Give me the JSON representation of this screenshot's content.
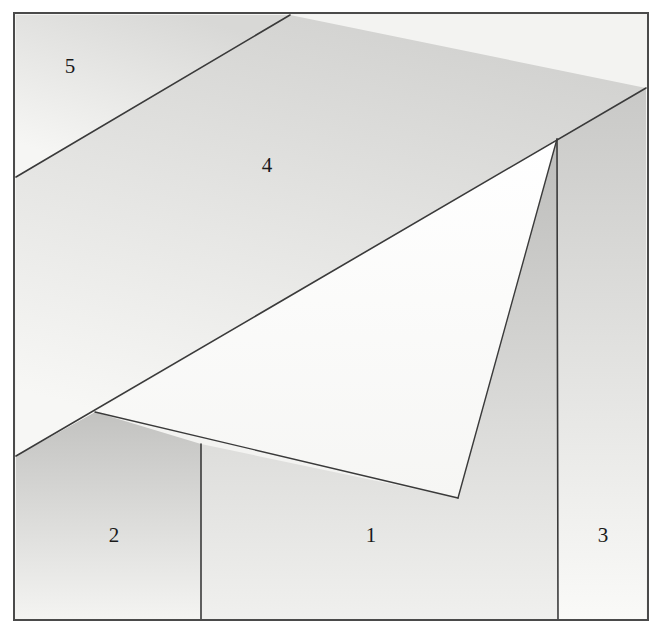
{
  "figure": {
    "canvas": {
      "width": 661,
      "height": 636
    },
    "frame": {
      "name": "outer-frame",
      "x": 14,
      "y": 13,
      "width": 634,
      "height": 607,
      "stroke_color": "#4a4a4a",
      "stroke_width": 2,
      "fill_color": "#f3f3f1"
    },
    "palette": {
      "background": "#ffffff",
      "line_color": "#3a3a3a",
      "label_color": "#1a1a1a",
      "region_light": "#fbfbfa",
      "region_mid": "#e4e4e2",
      "region_dark": "#c6c6c4"
    },
    "regions": [
      {
        "id": "region-1",
        "label": "1",
        "label_x": 371,
        "label_y": 537,
        "shape": "polygon",
        "points": "201,444 458,498 557,139 557,620 201,620",
        "fill_start": "#bdbdbb",
        "fill_end": "#f0f0ee",
        "gradient_angle_deg": 90,
        "description": "Large lower-middle region bounded by the vertical divider at x=201, the triangle's lower edges and the divider at x=557"
      },
      {
        "id": "region-2",
        "label": "2",
        "label_x": 114,
        "label_y": 537,
        "shape": "polygon",
        "points": "16,456 95,412 201,444 201,620 16,620",
        "fill_start": "#c2c2c0",
        "fill_end": "#f4f4f2",
        "gradient_angle_deg": 90,
        "description": "Lower-left region left of the vertical divider at x=201"
      },
      {
        "id": "region-3",
        "label": "3",
        "label_x": 603,
        "label_y": 537,
        "shape": "polygon",
        "points": "557,139 646,88 646,620 557,620",
        "fill_start": "#c9c9c7",
        "fill_end": "#fafaf8",
        "gradient_angle_deg": 90,
        "description": "Narrow right-hand strip between the divider at x=557 and the right frame edge"
      },
      {
        "id": "region-4",
        "label": "4",
        "label_x": 267,
        "label_y": 167,
        "shape": "polygon",
        "points": "290,15 646,88 557,139 95,412 16,456 16,177",
        "fill_start": "#d2d2d0",
        "fill_end": "#f7f7f5",
        "gradient_angle_deg": 110,
        "description": "Broad band across the middle of the square above the long diagonal"
      },
      {
        "id": "region-5",
        "label": "5",
        "label_x": 70,
        "label_y": 68,
        "shape": "polygon",
        "points": "16,15 290,15 16,177",
        "fill_start": "#d8d8d6",
        "fill_end": "#f6f6f4",
        "gradient_angle_deg": 120,
        "description": "Upper-left corner triangle above the first diagonal"
      },
      {
        "id": "region-triangle",
        "label": "",
        "label_x": 0,
        "label_y": 0,
        "shape": "polygon",
        "points": "95,412 557,139 458,498",
        "fill_start": "#ffffff",
        "fill_end": "#f6f6f4",
        "gradient_angle_deg": 90,
        "description": "Bright unlabelled triangle with apex at top right"
      }
    ],
    "lines": [
      {
        "id": "line-diagonal-5",
        "from_x": 16,
        "from_y": 177,
        "to_x": 290,
        "to_y": 15,
        "width": 1.6,
        "description": "Diagonal separating region 5 from region 4"
      },
      {
        "id": "line-long-diagonal",
        "from_x": 16,
        "from_y": 456,
        "to_x": 646,
        "to_y": 88,
        "width": 1.6,
        "description": "Long diagonal from left edge up to the right edge through the apex"
      },
      {
        "id": "line-triangle-left-edge",
        "from_x": 95,
        "from_y": 412,
        "to_x": 458,
        "to_y": 498,
        "width": 1.4,
        "description": "Lower-left edge of the bright triangle"
      },
      {
        "id": "line-triangle-right-edge",
        "from_x": 458,
        "from_y": 498,
        "to_x": 557,
        "to_y": 139,
        "width": 1.4,
        "description": "Right edge of the bright triangle rising to the apex"
      },
      {
        "id": "line-divider-1-3",
        "from_x": 557,
        "from_y": 139,
        "to_x": 558,
        "to_y": 620,
        "width": 1.6,
        "description": "Near-vertical divider between region 1 and region 3"
      },
      {
        "id": "line-divider-2-1",
        "from_x": 201,
        "from_y": 444,
        "to_x": 201,
        "to_y": 620,
        "width": 1.6,
        "description": "Vertical divider between region 2 and region 1"
      }
    ],
    "labels": [
      {
        "id": "label-1",
        "text": "1",
        "x": 371,
        "y": 537
      },
      {
        "id": "label-2",
        "text": "2",
        "x": 114,
        "y": 537
      },
      {
        "id": "label-3",
        "text": "3",
        "x": 603,
        "y": 537
      },
      {
        "id": "label-4",
        "text": "4",
        "x": 267,
        "y": 167
      },
      {
        "id": "label-5",
        "text": "5",
        "x": 70,
        "y": 68
      }
    ]
  }
}
